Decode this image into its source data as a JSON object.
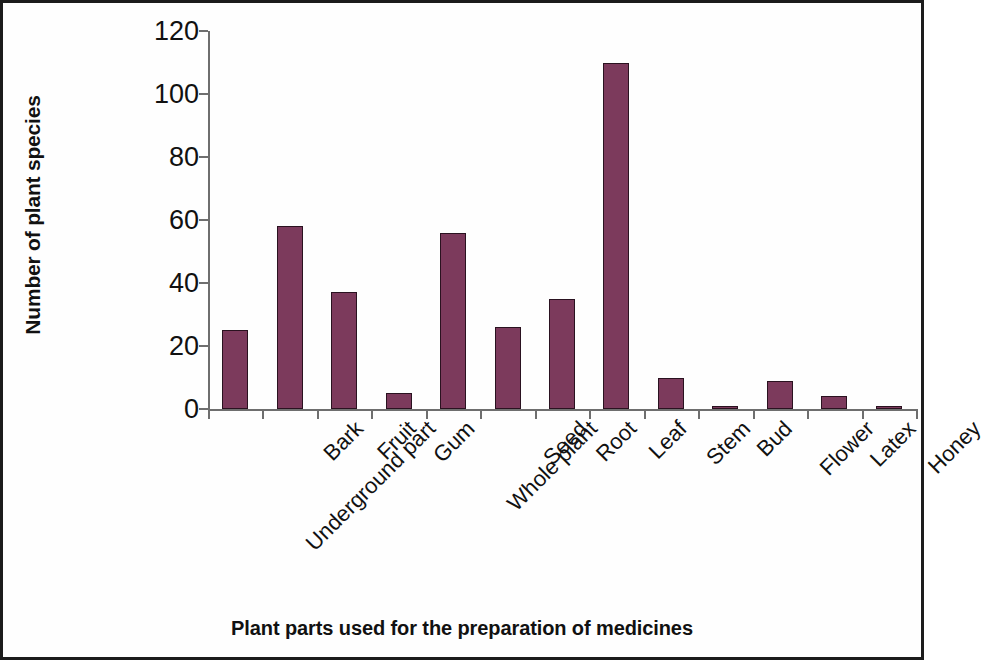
{
  "chart_data": {
    "type": "bar",
    "title": "",
    "xlabel": "Plant parts used for the preparation of medicines",
    "ylabel": "Number of plant species",
    "categories": [
      "Underground part",
      "Bark",
      "Fruit",
      "Gum",
      "Whole plant",
      "Seed",
      "Root",
      "Leaf",
      "Stem",
      "Bud",
      "Flower",
      "Latex",
      "Honey"
    ],
    "values": [
      25,
      58,
      37,
      5,
      56,
      26,
      35,
      110,
      10,
      1,
      9,
      4,
      1
    ],
    "ylim": [
      0,
      120
    ],
    "yticks": [
      0,
      20,
      40,
      60,
      80,
      100,
      120
    ],
    "ytick_labels": [
      "0",
      "20",
      "40",
      "60",
      "80",
      "100",
      "120"
    ],
    "grid": false,
    "legend": false,
    "bar_color": "#7c3a5c",
    "bar_edge_color": "#2a1220",
    "axis_color": "#6e6e6e",
    "frame_color": "#1c1c1c"
  }
}
